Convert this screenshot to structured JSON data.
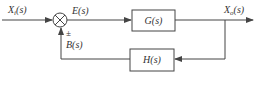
{
  "diagram": {
    "type": "feedback-control-block-diagram",
    "colors": {
      "line": "#444444",
      "text": "#333333",
      "background": "#ffffff"
    },
    "signals": {
      "input": {
        "base": "X",
        "sub": "i",
        "arg": "(s)"
      },
      "error": "E(s)",
      "output": {
        "base": "X",
        "sub": "o",
        "arg": "(s)"
      },
      "feedback": "B(s)",
      "sign": "±"
    },
    "blocks": {
      "forward": "G(s)",
      "feedback": "H(s)"
    }
  }
}
